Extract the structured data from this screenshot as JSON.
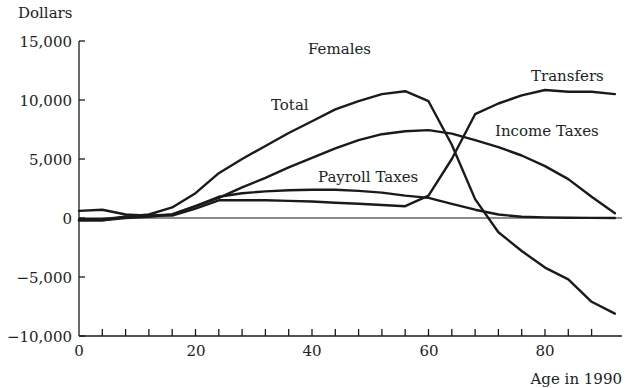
{
  "chart_data": {
    "type": "line",
    "title": "Females",
    "xlabel": "Age in 1990",
    "ylabel": "Dollars",
    "xlim": [
      0,
      93
    ],
    "ylim": [
      -10000,
      15000
    ],
    "x_ticks": [
      0,
      20,
      40,
      60,
      80
    ],
    "x_tick_labels": [
      "0",
      "20",
      "40",
      "60",
      "80"
    ],
    "x_minor_tick_step": 4,
    "y_ticks": [
      -10000,
      -5000,
      0,
      5000,
      10000,
      15000
    ],
    "y_tick_labels": [
      "−10,000",
      "−5,000",
      "0",
      "5,000",
      "10,000",
      "15,000"
    ],
    "grid": false,
    "legend": "inline annotations",
    "series": [
      {
        "name": "Total",
        "x": [
          0,
          4,
          8,
          12,
          16,
          20,
          24,
          28,
          32,
          36,
          40,
          44,
          48,
          52,
          56,
          60,
          64,
          68,
          72,
          76,
          80,
          84,
          88,
          92
        ],
        "values": [
          -100,
          -100,
          100,
          300,
          900,
          2100,
          3800,
          5000,
          6100,
          7200,
          8200,
          9200,
          9900,
          10500,
          10750,
          9900,
          6200,
          1600,
          -1200,
          -2800,
          -4200,
          -5200,
          -7100,
          -8100
        ]
      },
      {
        "name": "Income Taxes",
        "x": [
          0,
          4,
          8,
          12,
          16,
          20,
          24,
          28,
          32,
          36,
          40,
          44,
          48,
          52,
          56,
          60,
          64,
          68,
          72,
          76,
          80,
          84,
          88,
          92
        ],
        "values": [
          -200,
          -200,
          100,
          200,
          300,
          1000,
          1700,
          2600,
          3400,
          4300,
          5100,
          5900,
          6600,
          7100,
          7350,
          7450,
          7150,
          6600,
          6000,
          5300,
          4400,
          3300,
          1800,
          400
        ]
      },
      {
        "name": "Payroll Taxes",
        "x": [
          0,
          4,
          8,
          12,
          16,
          20,
          24,
          28,
          32,
          36,
          40,
          44,
          48,
          52,
          56,
          60,
          64,
          68,
          72,
          76,
          80,
          84,
          88,
          92
        ],
        "values": [
          -200,
          -200,
          0,
          100,
          300,
          1000,
          1800,
          2100,
          2250,
          2350,
          2400,
          2400,
          2300,
          2150,
          1900,
          1700,
          1200,
          700,
          300,
          100,
          50,
          20,
          10,
          0
        ]
      },
      {
        "name": "Transfers",
        "x": [
          0,
          4,
          8,
          12,
          16,
          20,
          24,
          28,
          32,
          36,
          40,
          44,
          48,
          52,
          56,
          60,
          64,
          68,
          72,
          76,
          80,
          84,
          88,
          92
        ],
        "values": [
          600,
          700,
          300,
          200,
          200,
          800,
          1500,
          1500,
          1500,
          1450,
          1400,
          1300,
          1200,
          1100,
          1000,
          1900,
          5000,
          8800,
          9700,
          10400,
          10850,
          10700,
          10700,
          10500
        ]
      }
    ],
    "annotations": [
      {
        "text": "Females",
        "x": 44,
        "y": 14200
      },
      {
        "text": "Total",
        "x": 37,
        "y": 9500
      },
      {
        "text": "Transfers",
        "x": 81,
        "y": 12300
      },
      {
        "text": "Income Taxes",
        "x": 80,
        "y": 7300
      },
      {
        "text": "Payroll Taxes",
        "x": 51,
        "y": 3300
      }
    ]
  },
  "labels": {
    "ylabel": "Dollars",
    "xlabel": "Age in 1990",
    "title": "Females",
    "total": "Total",
    "transfers": "Transfers",
    "income_taxes": "Income Taxes",
    "payroll_taxes": "Payroll Taxes",
    "y_ticks": [
      "15,000",
      "10,000",
      "5,000",
      "0",
      "−5,000",
      "−10,000"
    ],
    "x_ticks": [
      "0",
      "20",
      "40",
      "60",
      "80"
    ]
  }
}
